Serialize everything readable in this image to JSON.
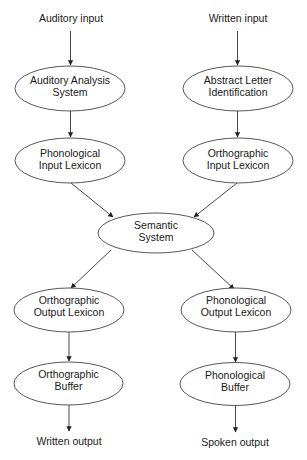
{
  "diagram": {
    "type": "flowchart",
    "inputs": {
      "auditory": "Auditory input",
      "written": "Written input"
    },
    "outputs": {
      "written": "Written output",
      "spoken": "Spoken output"
    },
    "nodes": {
      "auditory_analysis": {
        "line1": "Auditory Analysis",
        "line2": "System"
      },
      "abstract_letter": {
        "line1": "Abstract Letter",
        "line2": "Identification"
      },
      "phon_input_lexicon": {
        "line1": "Phonological",
        "line2": "Input Lexicon"
      },
      "orth_input_lexicon": {
        "line1": "Orthographic",
        "line2": "Input Lexicon"
      },
      "semantic_system": {
        "line1": "Semantic",
        "line2": "System"
      },
      "orth_output_lexicon": {
        "line1": "Orthographic",
        "line2": "Output Lexicon"
      },
      "phon_output_lexicon": {
        "line1": "Phonological",
        "line2": "Output Lexicon"
      },
      "orth_buffer": {
        "line1": "Orthographic",
        "line2": "Buffer"
      },
      "phon_buffer": {
        "line1": "Phonological",
        "line2": "Buffer"
      }
    },
    "edges": [
      [
        "Auditory input",
        "Auditory Analysis System"
      ],
      [
        "Auditory Analysis System",
        "Phonological Input Lexicon"
      ],
      [
        "Written input",
        "Abstract Letter Identification"
      ],
      [
        "Abstract Letter Identification",
        "Orthographic Input Lexicon"
      ],
      [
        "Phonological Input Lexicon",
        "Semantic System"
      ],
      [
        "Orthographic Input Lexicon",
        "Semantic System"
      ],
      [
        "Semantic System",
        "Orthographic Output Lexicon"
      ],
      [
        "Semantic System",
        "Phonological Output Lexicon"
      ],
      [
        "Orthographic Output Lexicon",
        "Orthographic Buffer"
      ],
      [
        "Phonological Output Lexicon",
        "Phonological Buffer"
      ],
      [
        "Orthographic Buffer",
        "Written output"
      ],
      [
        "Phonological Buffer",
        "Spoken output"
      ]
    ],
    "colors": {
      "stroke": "#444444",
      "text": "#1a1a1a",
      "background": "#ffffff"
    }
  }
}
